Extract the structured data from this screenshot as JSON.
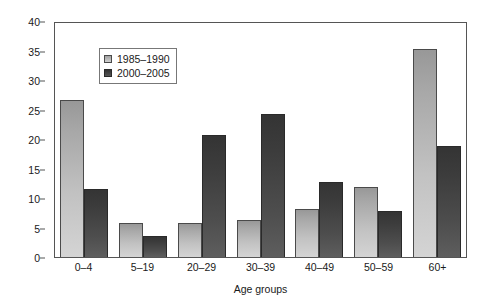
{
  "chart_data": {
    "type": "bar",
    "title": "",
    "xlabel": "Age groups",
    "ylabel": "% of total deaths",
    "ylim": [
      0,
      40
    ],
    "yticks": [
      0,
      5,
      10,
      15,
      20,
      25,
      30,
      35,
      40
    ],
    "ytick_labels": [
      "0",
      "5",
      "10",
      "15",
      "20",
      "25",
      "30",
      "35",
      "40"
    ],
    "grid": false,
    "legend_position": "upper-left-inside",
    "categories": [
      "0–4",
      "5–19",
      "20–29",
      "30–39",
      "40–49",
      "50–59",
      "60+"
    ],
    "series": [
      {
        "name": "1985–1990",
        "color": "#b8b8b8",
        "values": [
          26.8,
          5.8,
          5.8,
          6.3,
          8.2,
          11.9,
          35.5
        ]
      },
      {
        "name": "2000–2005",
        "color": "#474747",
        "values": [
          11.7,
          3.6,
          20.9,
          24.5,
          12.9,
          7.9,
          19.0
        ]
      }
    ]
  },
  "axis": {
    "frame_color": "#555555"
  }
}
